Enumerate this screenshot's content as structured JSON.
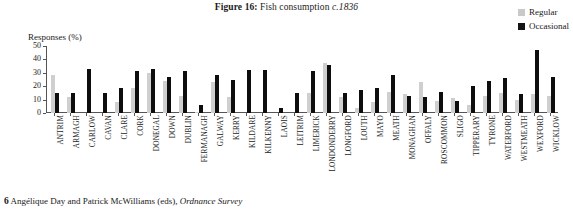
{
  "title": {
    "lead": "Figure",
    "number": "16:",
    "main": "Fish consumption",
    "citation": "c.1836"
  },
  "legend": {
    "position": "top-right",
    "items": [
      {
        "label": "Regular",
        "color": "#c9c9c9",
        "icon": "square-swatch-icon"
      },
      {
        "label": "Occasional",
        "color": "#141414",
        "icon": "square-swatch-icon"
      }
    ]
  },
  "footnote": {
    "marker": "6",
    "text": "Angélique Day and Patrick McWilliams (eds),",
    "source": "Ordnance Survey"
  },
  "chart_data": {
    "type": "bar",
    "title": "Fish consumption c.1836",
    "xlabel": "",
    "ylabel": "Responses (%)",
    "ylim": [
      0,
      50
    ],
    "yticks": [
      0,
      10,
      20,
      30,
      40,
      50
    ],
    "grid": false,
    "legend_position": "top-right",
    "categories": [
      "ANTRIM",
      "ARMAGH",
      "CARLOW",
      "CAVAN",
      "CLARE",
      "CORK",
      "DONEGAL",
      "DOWN",
      "DUBLIN",
      "FERMANAGH",
      "GALWAY",
      "KERRY",
      "KILDARE",
      "KILKENNY",
      "LAOIS",
      "LEITRIM",
      "LIMERICK",
      "LONDONDERRY",
      "LONGFORD",
      "LOUTH",
      "MAYO",
      "MEATH",
      "MONAGHAN",
      "OFFALY",
      "ROSCOMMON",
      "SLIGO",
      "TIPPERARY",
      "TYRONE",
      "WATERFORD",
      "WESTMEATH",
      "WEXFORD",
      "WICKLOW"
    ],
    "series": [
      {
        "name": "Regular",
        "color": "#cfcfcf",
        "values": [
          28,
          12,
          0,
          0,
          8,
          19,
          30,
          24,
          13,
          1,
          23,
          12,
          0,
          0,
          0,
          0,
          15,
          37,
          12,
          4,
          8,
          16,
          14,
          23,
          9,
          11,
          6,
          13,
          15,
          10,
          14,
          13
        ]
      },
      {
        "name": "Occasional",
        "color": "#0d0d0d",
        "values": [
          15,
          15,
          33,
          15,
          19,
          31,
          33,
          27,
          31,
          6,
          28,
          25,
          32,
          32,
          4,
          15,
          31,
          36,
          15,
          17,
          19,
          28,
          13,
          12,
          16,
          9,
          20,
          24,
          26,
          14,
          47,
          27
        ]
      }
    ]
  }
}
